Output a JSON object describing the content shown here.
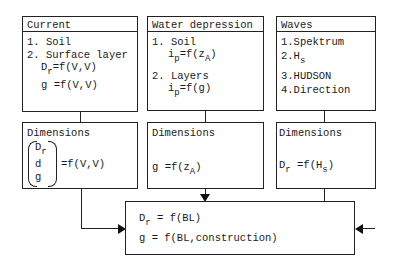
{
  "current": {
    "title": "Current",
    "items": [
      "1. Soil",
      "2. Surface layer"
    ],
    "eq1": {
      "lhs": "D",
      "sub": "r",
      "rhs": "=f(V,V)"
    },
    "eq2": {
      "lhs": "g",
      "rhs": "=f(V,V)"
    },
    "dimensions": {
      "title": "Dimensions",
      "vector": [
        {
          "t": "D",
          "sub": "r"
        },
        {
          "t": "d"
        },
        {
          "t": "g"
        }
      ],
      "rhs": "=f(V,V)"
    }
  },
  "water": {
    "title": "Water depression",
    "item1": "1. Soil",
    "eq1": {
      "lhs": "i",
      "sub": "p",
      "rhs_a": "=f(z",
      "rhs_sub": "A",
      "rhs_b": ")"
    },
    "item2": "2. Layers",
    "eq2": {
      "lhs": "i",
      "sub": "p",
      "rhs": "=f(g)"
    },
    "dimensions": {
      "title": "Dimensions",
      "eq": {
        "lhs": "g",
        "rhs_a": "=f(z",
        "rhs_sub": "A",
        "rhs_b": ")"
      }
    }
  },
  "waves": {
    "title": "Waves",
    "item1": "1.Spektrum",
    "item2": {
      "t": "2.H",
      "sub": "s"
    },
    "item3": "3.HUDSON",
    "item4": "4.Direction",
    "dimensions": {
      "title": "Dimensions",
      "eq": {
        "lhs": "D",
        "sub": "r",
        "rhs_a": "=f(H",
        "rhs_sub": "s",
        "rhs_b": ")"
      }
    }
  },
  "result": {
    "eq1": {
      "lhs": "D",
      "sub": "r",
      "rhs": "= f(BL)"
    },
    "eq2": {
      "lhs": "g",
      "rhs": "= f(BL,construction)"
    }
  }
}
